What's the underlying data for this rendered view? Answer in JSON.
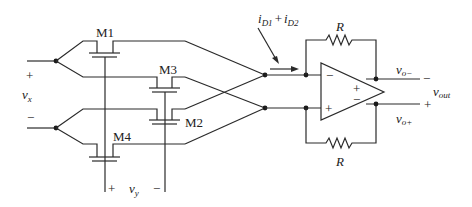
{
  "diagram": {
    "type": "circuit-schematic",
    "transistors": [
      {
        "id": "M1",
        "label": "M1"
      },
      {
        "id": "M2",
        "label": "M2"
      },
      {
        "id": "M3",
        "label": "M3"
      },
      {
        "id": "M4",
        "label": "M4"
      }
    ],
    "inputs": {
      "vx": {
        "var": "v",
        "sub": "x",
        "plus": "+",
        "minus": "−"
      },
      "vy": {
        "var": "v",
        "sub": "y",
        "plus": "+",
        "minus": "−"
      }
    },
    "current_label": {
      "i1": "i",
      "i1_sub": "D1",
      "plus": "+",
      "i2": "i",
      "i2_sub": "D2"
    },
    "resistors": [
      {
        "id": "R_top",
        "label": "R"
      },
      {
        "id": "R_bottom",
        "label": "R"
      }
    ],
    "opamp": {
      "inputs": {
        "inverting": "−",
        "noninverting": "+"
      },
      "outputs": {
        "top_sign": "+",
        "bottom_sign": "−"
      }
    },
    "outputs": {
      "vo_minus": {
        "var": "v",
        "sub": "o−",
        "sign": "−"
      },
      "vo_plus": {
        "var": "v",
        "sub": "o+",
        "sign": "+"
      },
      "vout": {
        "var": "v",
        "sub": "out"
      }
    }
  }
}
